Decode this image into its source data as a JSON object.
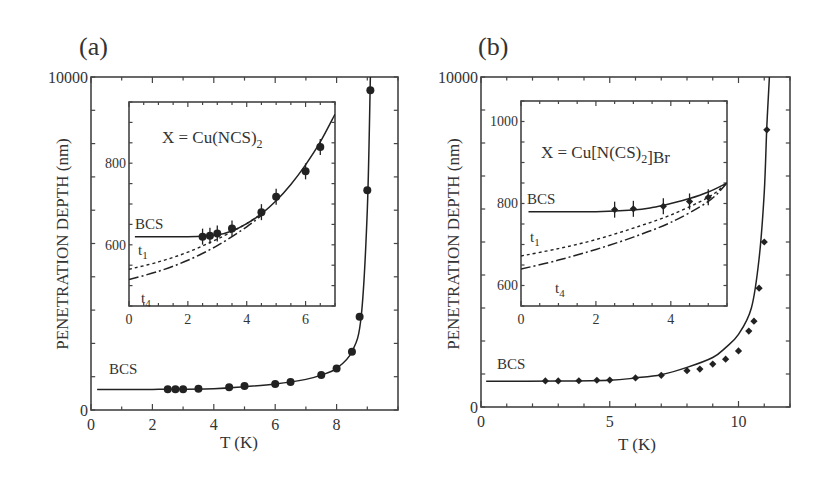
{
  "figure": {
    "panels": [
      {
        "id": "a",
        "label": "(a)",
        "xlabel": "T (K)",
        "ylabel": "PENETRATION DEPTH  (nm)",
        "curve_label": "BCS"
      },
      {
        "id": "b",
        "label": "(b)",
        "xlabel": "T (K)",
        "ylabel": "PENETRATION DEPTH  (nm)",
        "curve_label": "BCS"
      }
    ]
  },
  "chart_data": [
    {
      "type": "scatter",
      "panel": "(a) main",
      "title": "",
      "xlabel": "T (K)",
      "ylabel": "PENETRATION DEPTH  (nm)",
      "xlim": [
        0,
        10
      ],
      "ylim": [
        0,
        10000
      ],
      "xticks": [
        0,
        2,
        4,
        6,
        8
      ],
      "yticks": [
        0,
        10000
      ],
      "grid": false,
      "series": [
        {
          "name": "data",
          "style": "filled-circle",
          "x": [
            2.5,
            2.75,
            3.0,
            3.5,
            4.5,
            5.0,
            6.0,
            6.5,
            7.5,
            8.0,
            8.5,
            8.75,
            9.0,
            9.1
          ],
          "y": [
            620,
            620,
            625,
            635,
            680,
            720,
            780,
            840,
            1050,
            1250,
            1750,
            2800,
            6600,
            9600
          ]
        },
        {
          "name": "BCS",
          "style": "solid-line",
          "x": [
            0.2,
            2,
            4,
            5,
            6,
            7,
            7.5,
            8,
            8.5,
            8.8,
            9.0,
            9.1
          ],
          "y": [
            615,
            618,
            640,
            700,
            780,
            920,
            1050,
            1250,
            1750,
            2800,
            6000,
            10000
          ]
        }
      ],
      "annotations": [
        "BCS"
      ]
    },
    {
      "type": "scatter",
      "panel": "(a) inset",
      "title": "X = Cu(NCS)2",
      "xlabel": "",
      "ylabel": "",
      "xlim": [
        0,
        7
      ],
      "ylim": [
        450,
        950
      ],
      "xticks": [
        0,
        2,
        4,
        6
      ],
      "yticks": [
        600,
        800
      ],
      "series": [
        {
          "name": "data",
          "style": "filled-circle-errorbar",
          "x": [
            2.5,
            2.75,
            3.0,
            3.5,
            4.5,
            5.0,
            6.0,
            6.5
          ],
          "y": [
            620,
            622,
            628,
            640,
            680,
            718,
            780,
            840
          ]
        },
        {
          "name": "BCS",
          "style": "solid-line",
          "x": [
            0.2,
            2.0,
            3.0,
            3.5,
            4.0,
            4.5,
            5.0,
            5.5,
            6.0,
            6.5,
            7.0
          ],
          "y": [
            620,
            620,
            624,
            634,
            652,
            676,
            708,
            748,
            796,
            852,
            920
          ]
        },
        {
          "name": "t1",
          "style": "dotted-line",
          "x": [
            0,
            1,
            2,
            3,
            4,
            4.5
          ],
          "y": [
            540,
            558,
            582,
            614,
            652,
            676
          ]
        },
        {
          "name": "t4",
          "style": "dash-dot-line",
          "x": [
            0,
            1,
            2,
            3,
            4,
            4.5
          ],
          "y": [
            515,
            535,
            562,
            598,
            644,
            672
          ]
        }
      ],
      "annotations": [
        "BCS",
        "t1",
        "t4",
        "X = Cu(NCS)2"
      ]
    },
    {
      "type": "scatter",
      "panel": "(b) main",
      "title": "",
      "xlabel": "T (K)",
      "ylabel": "PENETRATION DEPTH  (nm)",
      "xlim": [
        0,
        12
      ],
      "ylim": [
        0,
        10000
      ],
      "xticks": [
        0,
        5,
        10
      ],
      "yticks": [
        0,
        10000
      ],
      "grid": false,
      "series": [
        {
          "name": "data",
          "style": "filled-diamond",
          "x": [
            2.5,
            3.0,
            3.8,
            4.5,
            5.0,
            6.0,
            7.0,
            8.0,
            8.5,
            9.0,
            9.5,
            10.0,
            10.4,
            10.6,
            10.8,
            11.0,
            11.1
          ],
          "y": [
            790,
            790,
            795,
            810,
            815,
            880,
            960,
            1100,
            1150,
            1300,
            1450,
            1700,
            2300,
            2600,
            3600,
            5000,
            8400
          ]
        },
        {
          "name": "BCS",
          "style": "solid-line",
          "x": [
            0.2,
            3,
            5,
            6,
            7,
            8,
            9,
            9.5,
            10,
            10.5,
            10.8,
            11.0,
            11.1,
            11.2
          ],
          "y": [
            780,
            785,
            810,
            880,
            980,
            1200,
            1500,
            1800,
            2200,
            3000,
            4500,
            6500,
            8500,
            10000
          ]
        }
      ],
      "annotations": [
        "BCS"
      ]
    },
    {
      "type": "scatter",
      "panel": "(b) inset",
      "title": "X = Cu[N(CS)2]Br",
      "xlabel": "",
      "ylabel": "",
      "xlim": [
        0,
        5.5
      ],
      "ylim": [
        550,
        1050
      ],
      "xticks": [
        0,
        2,
        4
      ],
      "yticks": [
        600,
        800,
        1000
      ],
      "series": [
        {
          "name": "data",
          "style": "filled-diamond-errorbar",
          "x": [
            2.5,
            3.0,
            3.8,
            4.5,
            5.0
          ],
          "y": [
            785,
            787,
            793,
            805,
            815
          ]
        },
        {
          "name": "BCS",
          "style": "solid-line",
          "x": [
            0.2,
            2.0,
            3.0,
            3.5,
            4.0,
            4.5,
            5.0,
            5.5
          ],
          "y": [
            780,
            780,
            784,
            790,
            800,
            812,
            828,
            850
          ]
        },
        {
          "name": "t1",
          "style": "dotted-line",
          "x": [
            0,
            1,
            2,
            3,
            4,
            5,
            5.5
          ],
          "y": [
            672,
            690,
            712,
            740,
            772,
            815,
            850
          ]
        },
        {
          "name": "t4",
          "style": "dash-dot-line",
          "x": [
            0,
            1,
            2,
            3,
            4,
            5,
            5.5
          ],
          "y": [
            640,
            662,
            688,
            718,
            754,
            805,
            850
          ]
        }
      ],
      "annotations": [
        "BCS",
        "t1",
        "t4",
        "X = Cu[N(CS)2]Br"
      ]
    }
  ]
}
